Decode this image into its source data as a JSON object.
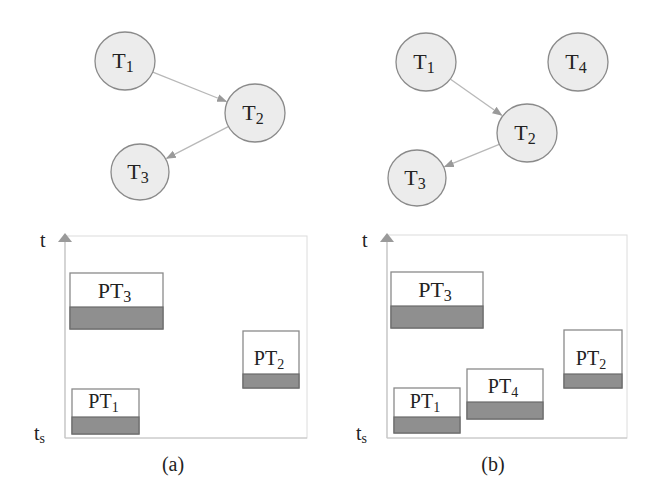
{
  "panels": [
    {
      "caption": "(a)",
      "axis": {
        "y_top_label": "t",
        "y_bottom_label": "t",
        "y_bottom_sub": "s"
      },
      "graph": {
        "nodes": [
          {
            "id": "T1",
            "label": "T",
            "sub": "1",
            "cx": 125,
            "cy": 61,
            "r": 30
          },
          {
            "id": "T2",
            "label": "T",
            "sub": "2",
            "cx": 255,
            "cy": 113,
            "r": 30
          },
          {
            "id": "T3",
            "label": "T",
            "sub": "3",
            "cx": 140,
            "cy": 172,
            "r": 29
          }
        ],
        "edges": [
          {
            "from": "T1",
            "to": "T2"
          },
          {
            "from": "T2",
            "to": "T3"
          }
        ]
      },
      "blocks": [
        {
          "label": "PT",
          "sub": "3",
          "x": 70,
          "y": 273,
          "w": 93,
          "h": 56,
          "split": 34
        },
        {
          "label": "PT",
          "sub": "2",
          "x": 243,
          "y": 331,
          "w": 56,
          "h": 57,
          "split": 43
        },
        {
          "label": "PT",
          "sub": "1",
          "x": 72,
          "y": 389,
          "w": 67,
          "h": 45,
          "split": 28
        }
      ]
    },
    {
      "caption": "(b)",
      "axis": {
        "y_top_label": "t",
        "y_bottom_label": "t",
        "y_bottom_sub": "s"
      },
      "graph": {
        "nodes": [
          {
            "id": "T1",
            "label": "T",
            "sub": "1",
            "cx": 426,
            "cy": 62,
            "r": 30
          },
          {
            "id": "T4",
            "label": "T",
            "sub": "4",
            "cx": 578,
            "cy": 62,
            "r": 30
          },
          {
            "id": "T2",
            "label": "T",
            "sub": "2",
            "cx": 527,
            "cy": 133,
            "r": 30
          },
          {
            "id": "T3",
            "label": "T",
            "sub": "3",
            "cx": 417,
            "cy": 178,
            "r": 29
          }
        ],
        "edges": [
          {
            "from": "T1",
            "to": "T2"
          },
          {
            "from": "T2",
            "to": "T3"
          }
        ]
      },
      "blocks": [
        {
          "label": "PT",
          "sub": "3",
          "x": 391,
          "y": 272,
          "w": 92,
          "h": 56,
          "split": 34
        },
        {
          "label": "PT",
          "sub": "2",
          "x": 564,
          "y": 330,
          "w": 58,
          "h": 58,
          "split": 44
        },
        {
          "label": "PT",
          "sub": "4",
          "x": 467,
          "y": 369,
          "w": 76,
          "h": 50,
          "split": 33
        },
        {
          "label": "PT",
          "sub": "1",
          "x": 394,
          "y": 388,
          "w": 66,
          "h": 45,
          "split": 29
        }
      ]
    }
  ],
  "colors": {
    "node_fill": "#ececec",
    "block_fill_dark": "#8f8f8f",
    "axis": "#c4c4c4"
  }
}
